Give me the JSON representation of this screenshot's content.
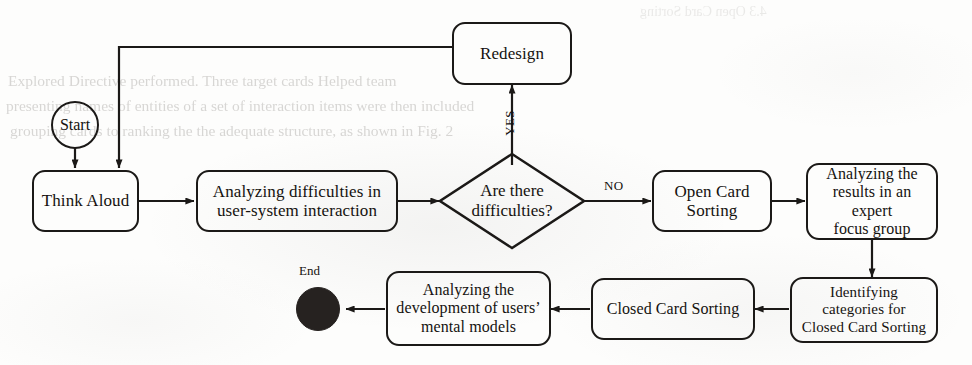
{
  "diagram": {
    "stroke_color": "#1b1917",
    "text_color": "#15120f",
    "end_fill_color": "#262220",
    "background_color": "#fdfdfc"
  },
  "nodes": {
    "start": {
      "label": "Start",
      "shape": "circle"
    },
    "think_aloud": {
      "label": "Think Aloud",
      "shape": "rounded-rect"
    },
    "analyzing_difficulties": {
      "line1": "Analyzing difficulties in",
      "line2": "user-system interaction",
      "shape": "rounded-rect"
    },
    "decision": {
      "line1": "Are there",
      "line2": "difficulties?",
      "shape": "diamond"
    },
    "redesign": {
      "label": "Redesign",
      "shape": "rounded-rect"
    },
    "open_card_sorting": {
      "line1": "Open Card",
      "line2": "Sorting",
      "shape": "rounded-rect"
    },
    "expert_focus_group": {
      "line1": "Analyzing the",
      "line2": "results in an expert",
      "line3": "focus group",
      "shape": "rounded-rect"
    },
    "identifying_categories": {
      "line1": "Identifying",
      "line2": "categories for",
      "line3": "Closed Card Sorting",
      "shape": "rounded-rect"
    },
    "closed_card_sorting": {
      "label": "Closed Card Sorting",
      "shape": "rounded-rect"
    },
    "mental_models": {
      "line1": "Analyzing the",
      "line2": "development of users’",
      "line3": "mental models",
      "shape": "rounded-rect"
    },
    "end": {
      "label": "End",
      "shape": "filled-circle"
    }
  },
  "edge_labels": {
    "yes": "YES",
    "no": "NO"
  },
  "ghost_text": {
    "note": "faint bleed-through from the reverse side of the scanned page",
    "heading": "4.3  Open Card Sorting",
    "lines": [
      "Explored Directive performed. Three target cards Helped team",
      "presenting names of entities of a set of interaction items were then included",
      "grouping cards to ranking the the adequate structure, as shown in Fig. 2"
    ]
  }
}
